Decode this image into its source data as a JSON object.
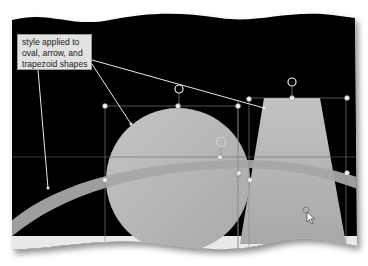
{
  "callout": {
    "lines": [
      "style applied to",
      "oval, arrow, and",
      "trapezoid shapes"
    ]
  },
  "colors": {
    "slide_background": "#000000",
    "shape_fill": "#b9b9b9",
    "arrow_fill": "#a5a5a5",
    "callout_fill": "#e2e2e2",
    "leader_line": "#e8e8e8",
    "selection_handle": "#f2f2f2"
  },
  "shapes": [
    {
      "type": "oval",
      "label": "oval"
    },
    {
      "type": "arrow",
      "label": "arrow"
    },
    {
      "type": "trapezoid",
      "label": "trapezoid"
    }
  ],
  "icons": {
    "rotate_handle": "rotate-icon",
    "cursor": "move-cursor-icon"
  }
}
